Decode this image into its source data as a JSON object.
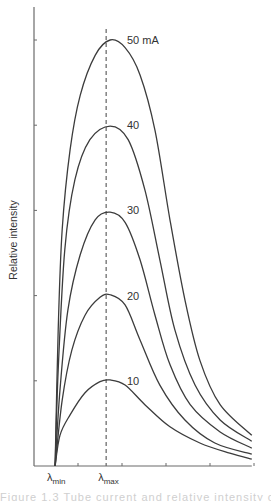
{
  "chart_data": {
    "type": "line",
    "title": "",
    "xlabel": "",
    "ylabel": "Relative intensity",
    "x_tick_labels": [
      {
        "text": "λ",
        "sub": "min",
        "x": 0.48
      },
      {
        "text": "λ",
        "sub": "max",
        "x": 1.64
      }
    ],
    "x_ticks": [
      1,
      2,
      3,
      4,
      5
    ],
    "y_ticks": [
      10,
      20,
      30,
      40,
      50
    ],
    "xlim": [
      0,
      4.95
    ],
    "ylim": [
      0,
      54
    ],
    "grid": false,
    "reference_line": {
      "type": "dashed-vertical",
      "x": 1.64,
      "label": "λmax"
    },
    "series": [
      {
        "name": "50 mA",
        "label": "50 mA",
        "peak": 50,
        "points": [
          [
            0.48,
            0
          ],
          [
            0.55,
            16
          ],
          [
            0.64,
            27.7
          ],
          [
            0.82,
            37.1
          ],
          [
            1.05,
            43.5
          ],
          [
            1.39,
            48.2
          ],
          [
            1.73,
            50
          ],
          [
            2.07,
            49.1
          ],
          [
            2.41,
            45.9
          ],
          [
            2.75,
            39.4
          ],
          [
            3.09,
            28.9
          ],
          [
            3.43,
            19.5
          ],
          [
            3.77,
            12.4
          ],
          [
            4.23,
            7.2
          ],
          [
            4.95,
            3.6
          ]
        ]
      },
      {
        "name": "40 mA",
        "label": "40",
        "peak": 40,
        "points": [
          [
            0.48,
            0
          ],
          [
            0.55,
            11.3
          ],
          [
            0.7,
            25.4
          ],
          [
            0.93,
            33.6
          ],
          [
            1.27,
            38.3
          ],
          [
            1.73,
            39.9
          ],
          [
            2.14,
            38.3
          ],
          [
            2.52,
            32.4
          ],
          [
            2.86,
            24.2
          ],
          [
            3.2,
            16
          ],
          [
            3.66,
            9.5
          ],
          [
            4.23,
            5.4
          ],
          [
            4.95,
            2.9
          ]
        ]
      },
      {
        "name": "30 mA",
        "label": "30",
        "peak": 30,
        "points": [
          [
            0.48,
            0
          ],
          [
            0.59,
            8.9
          ],
          [
            0.77,
            18.3
          ],
          [
            1.05,
            24.8
          ],
          [
            1.39,
            28.9
          ],
          [
            1.73,
            29.8
          ],
          [
            2.07,
            28.6
          ],
          [
            2.41,
            24.2
          ],
          [
            2.75,
            17.7
          ],
          [
            3.09,
            11.9
          ],
          [
            3.55,
            7.2
          ],
          [
            4.23,
            4.0
          ],
          [
            4.95,
            2.1
          ]
        ]
      },
      {
        "name": "20 mA",
        "label": "20",
        "peak": 20,
        "points": [
          [
            0.48,
            0
          ],
          [
            0.64,
            7.7
          ],
          [
            0.86,
            13.6
          ],
          [
            1.16,
            17.7
          ],
          [
            1.5,
            19.8
          ],
          [
            1.73,
            20.1
          ],
          [
            2.07,
            18.9
          ],
          [
            2.41,
            14.8
          ],
          [
            2.86,
            9.5
          ],
          [
            3.43,
            5.4
          ],
          [
            4.11,
            2.7
          ],
          [
            4.95,
            1.4
          ]
        ]
      },
      {
        "name": "10 mA",
        "label": "10",
        "peak": 10,
        "points": [
          [
            0.48,
            0
          ],
          [
            0.59,
            3.6
          ],
          [
            0.82,
            6.0
          ],
          [
            1.16,
            8.6
          ],
          [
            1.5,
            9.9
          ],
          [
            1.73,
            10.1
          ],
          [
            2.07,
            9.5
          ],
          [
            2.52,
            7.2
          ],
          [
            3.09,
            4.6
          ],
          [
            3.77,
            2.7
          ],
          [
            4.45,
            1.5
          ],
          [
            4.95,
            0.8
          ]
        ]
      }
    ]
  },
  "caption": "Figure 1.3   Tube current and relative intensity of X-rays"
}
